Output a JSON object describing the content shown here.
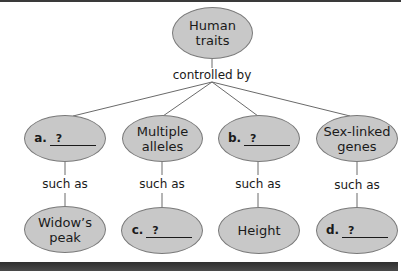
{
  "diagram": {
    "type": "concept-map",
    "colors": {
      "node_fill": "#c8c8c8",
      "node_border": "#7a7a7a",
      "line": "#6a6a6a",
      "text": "#1a1a1a"
    },
    "root": {
      "label_line1": "Human",
      "label_line2": "traits"
    },
    "root_link_label": "controlled by",
    "level2": [
      {
        "letter": "a.",
        "blank": "?"
      },
      {
        "label_line1": "Multiple",
        "label_line2": "alleles"
      },
      {
        "letter": "b.",
        "blank": "?"
      },
      {
        "label_line1": "Sex-linked",
        "label_line2": "genes"
      }
    ],
    "level2_link_labels": [
      "such as",
      "such as",
      "such as",
      "such as"
    ],
    "level3": [
      {
        "label_line1": "Widow’s",
        "label_line2": "peak"
      },
      {
        "letter": "c.",
        "blank": "?"
      },
      {
        "label_line1": "Height"
      },
      {
        "letter": "d.",
        "blank": "?"
      }
    ]
  }
}
